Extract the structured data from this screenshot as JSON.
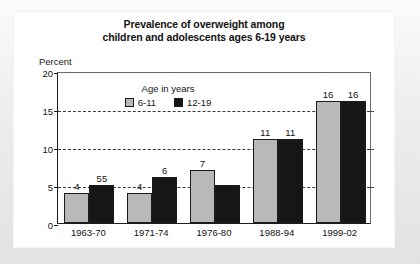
{
  "chart_data": {
    "type": "bar",
    "title": "Prevalence of overweight among children and adolescents ages 6-19 years",
    "title_lines": [
      "Prevalence of overweight among",
      "children and adolescents ages 6-19 years"
    ],
    "xlabel": "",
    "ylabel": "Percent",
    "ylim": [
      0,
      20
    ],
    "yticks": [
      0,
      5,
      10,
      15,
      20
    ],
    "ytick_labels": [
      "0",
      "5",
      "10",
      "15",
      "20"
    ],
    "gridlines": [
      5,
      10,
      15
    ],
    "grid": true,
    "legend_position": "inside-upper-left",
    "legend_title": "Age in years",
    "categories": [
      "1963-70",
      "1971-74",
      "1976-80",
      "1988-94",
      "1999-02"
    ],
    "series": [
      {
        "name": "6-11",
        "color": "#b9b9b9",
        "values": [
          4,
          4,
          7,
          11,
          16
        ],
        "data_labels": [
          "4",
          "4",
          "7",
          "11",
          "16"
        ]
      },
      {
        "name": "12-19",
        "color": "#161616",
        "values": [
          5,
          6,
          5,
          11,
          16
        ],
        "data_labels": [
          "55",
          "6",
          "",
          "11",
          "16"
        ]
      }
    ]
  },
  "colors": {
    "series_6_11": "#b9b9b9",
    "series_12_19": "#161616",
    "axis": "#1d1d1d",
    "grid": "#3a3a3a",
    "panel_background": "#ffffff",
    "frame_background": "#e8e8e8"
  }
}
